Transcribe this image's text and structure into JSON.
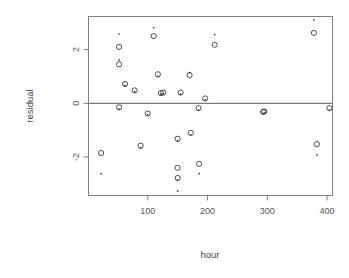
{
  "chart_data": {
    "type": "scatter",
    "title": "",
    "xlabel": "hour",
    "ylabel": "residual",
    "xlim": [
      0,
      410
    ],
    "ylim": [
      -3.45,
      3.25
    ],
    "grid": false,
    "legend": "none",
    "xticks": [
      100,
      200,
      300,
      400
    ],
    "yticks": [
      2,
      0,
      -2
    ],
    "xtick_labels": [
      "100",
      "200",
      "300",
      "400"
    ],
    "ytick_labels": [
      "2",
      "0",
      "-2"
    ],
    "annotations": [
      {
        "kind": "hline",
        "y": 0,
        "label": "zero reference line"
      }
    ],
    "series": [
      {
        "name": "observed",
        "marker": "circle",
        "points": [
          {
            "x": 22,
            "y": -1.85
          },
          {
            "x": 52,
            "y": 2.1
          },
          {
            "x": 52,
            "y": 1.45
          },
          {
            "x": 52,
            "y": -0.15
          },
          {
            "x": 62,
            "y": 0.72
          },
          {
            "x": 78,
            "y": 0.48
          },
          {
            "x": 88,
            "y": -1.58
          },
          {
            "x": 100,
            "y": -0.38
          },
          {
            "x": 110,
            "y": 2.5
          },
          {
            "x": 117,
            "y": 1.08
          },
          {
            "x": 122,
            "y": 0.38
          },
          {
            "x": 126,
            "y": 0.4
          },
          {
            "x": 150,
            "y": -1.32
          },
          {
            "x": 150,
            "y": -2.4
          },
          {
            "x": 150,
            "y": -2.78
          },
          {
            "x": 155,
            "y": 0.4
          },
          {
            "x": 170,
            "y": 1.05
          },
          {
            "x": 172,
            "y": -1.1
          },
          {
            "x": 185,
            "y": -0.18
          },
          {
            "x": 186,
            "y": -2.25
          },
          {
            "x": 196,
            "y": 0.18
          },
          {
            "x": 212,
            "y": 2.18
          },
          {
            "x": 293,
            "y": -0.32
          },
          {
            "x": 295,
            "y": -0.3
          },
          {
            "x": 378,
            "y": 2.62
          },
          {
            "x": 383,
            "y": -1.52
          },
          {
            "x": 404,
            "y": -0.18
          }
        ]
      },
      {
        "name": "fitted",
        "marker": "dot",
        "points": [
          {
            "x": 22,
            "y": -2.62
          },
          {
            "x": 52,
            "y": 2.58
          },
          {
            "x": 52,
            "y": 1.62
          },
          {
            "x": 52,
            "y": -0.22
          },
          {
            "x": 62,
            "y": 0.66
          },
          {
            "x": 78,
            "y": 0.44
          },
          {
            "x": 88,
            "y": -1.66
          },
          {
            "x": 100,
            "y": -0.42
          },
          {
            "x": 110,
            "y": 2.82
          },
          {
            "x": 117,
            "y": 1.0
          },
          {
            "x": 122,
            "y": 0.34
          },
          {
            "x": 126,
            "y": 0.36
          },
          {
            "x": 150,
            "y": -1.4
          },
          {
            "x": 150,
            "y": -2.86
          },
          {
            "x": 150,
            "y": -3.26
          },
          {
            "x": 155,
            "y": 0.34
          },
          {
            "x": 170,
            "y": 1.14
          },
          {
            "x": 172,
            "y": -1.18
          },
          {
            "x": 185,
            "y": -0.24
          },
          {
            "x": 186,
            "y": -2.62
          },
          {
            "x": 196,
            "y": 0.14
          },
          {
            "x": 212,
            "y": 2.56
          },
          {
            "x": 293,
            "y": -0.38
          },
          {
            "x": 295,
            "y": -0.36
          },
          {
            "x": 378,
            "y": 3.1
          },
          {
            "x": 383,
            "y": -1.92
          },
          {
            "x": 404,
            "y": -0.24
          }
        ]
      }
    ]
  },
  "plot": {
    "frame": {
      "left": 88,
      "top": 16,
      "right": 333,
      "bottom": 196
    },
    "axis_title_x": "hour",
    "axis_title_y": "residual"
  }
}
